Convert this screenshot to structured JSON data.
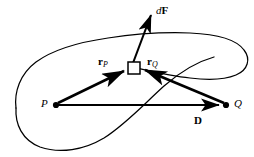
{
  "figure": {
    "background_color": "#ffffff",
    "stroke_color": "#000000",
    "width": 254,
    "height": 157,
    "labels": {
      "force_vector": "d",
      "force_vector_bold": "F",
      "r_from_p": "r",
      "r_from_p_sub": "P",
      "r_from_q": "r",
      "r_from_q_sub": "Q",
      "point_p": "P",
      "point_q": "Q",
      "displacement": "D"
    },
    "geometry": {
      "point_p": {
        "x": 56,
        "y": 105
      },
      "point_q": {
        "x": 226,
        "y": 105
      },
      "element_square": {
        "x": 128,
        "y": 62,
        "size": 12
      },
      "force_arrow_tip": {
        "x": 152,
        "y": 13
      }
    }
  }
}
